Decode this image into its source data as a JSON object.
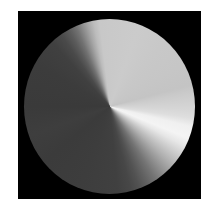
{
  "image": {
    "description": "Grayscale disk composed of many radial wedges forming a stepped conic gradient on a black square background",
    "background_color": "#000000",
    "page_color": "#ffffff",
    "disk": {
      "center_px": [
        110,
        107
      ],
      "radius_px": 86,
      "wedges": [
        {
          "start_deg": 350,
          "end_deg": 75,
          "color": "#c9c9c9",
          "label": "light-gray region"
        },
        {
          "start_deg": 75,
          "end_deg": 100,
          "color": "#d0d0d0",
          "label": "light bands"
        },
        {
          "start_deg": 100,
          "end_deg": 115,
          "color": "#f2f2f2",
          "label": "near-white highlight"
        },
        {
          "start_deg": 115,
          "end_deg": 165,
          "color": "#888888",
          "label": "darkening fan"
        },
        {
          "start_deg": 165,
          "end_deg": 325,
          "color": "#3c3c3c",
          "label": "dark-gray region"
        },
        {
          "start_deg": 325,
          "end_deg": 350,
          "color": "#8c8c8c",
          "label": "lightening fan"
        }
      ]
    }
  }
}
